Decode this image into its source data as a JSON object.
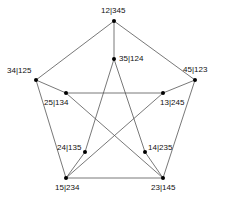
{
  "nodes": [
    {
      "id": "12|345",
      "x": 114,
      "y": 21,
      "lx": 101,
      "ly": 7
    },
    {
      "id": "45|123",
      "x": 195,
      "y": 80,
      "lx": 183,
      "ly": 66
    },
    {
      "id": "23|145",
      "x": 163,
      "y": 178,
      "lx": 151,
      "ly": 184
    },
    {
      "id": "15|234",
      "x": 66,
      "y": 178,
      "lx": 55,
      "ly": 184
    },
    {
      "id": "34|125",
      "x": 36,
      "y": 80,
      "lx": 7,
      "ly": 67
    },
    {
      "id": "35|124",
      "x": 114,
      "y": 59,
      "lx": 119,
      "ly": 55
    },
    {
      "id": "13|245",
      "x": 163,
      "y": 93,
      "lx": 160,
      "ly": 99
    },
    {
      "id": "14|235",
      "x": 145,
      "y": 152,
      "lx": 148,
      "ly": 144
    },
    {
      "id": "24|135",
      "x": 85,
      "y": 152,
      "lx": 57,
      "ly": 144
    },
    {
      "id": "25|134",
      "x": 66,
      "y": 93,
      "lx": 44,
      "ly": 99
    }
  ],
  "edges": [
    [
      "12|345",
      "45|123"
    ],
    [
      "45|123",
      "23|145"
    ],
    [
      "23|145",
      "15|234"
    ],
    [
      "15|234",
      "34|125"
    ],
    [
      "34|125",
      "12|345"
    ],
    [
      "12|345",
      "35|124"
    ],
    [
      "45|123",
      "13|245"
    ],
    [
      "23|145",
      "14|235"
    ],
    [
      "15|234",
      "24|135"
    ],
    [
      "34|125",
      "25|134"
    ],
    [
      "35|124",
      "24|135"
    ],
    [
      "35|124",
      "14|235"
    ],
    [
      "25|134",
      "13|245"
    ],
    [
      "25|134",
      "23|145"
    ],
    [
      "13|245",
      "15|234"
    ]
  ]
}
